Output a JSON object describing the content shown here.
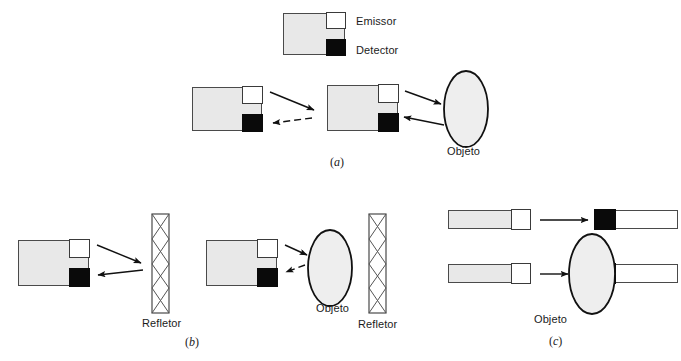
{
  "figure": {
    "caption_style": "three-panel optical sensor principle diagram",
    "background": "#ffffff",
    "stroke": "#1b1b1b",
    "body_fill": "#e8e8e8",
    "detector_fill": "#0a0a0a",
    "emitter_fill": "#ffffff"
  },
  "legend": {
    "emissor_label": "Emissor",
    "detector_label": "Detector"
  },
  "panels": [
    {
      "id": "a",
      "label": "(a)",
      "label_text": "a",
      "objects": [
        {
          "name": "objeto",
          "label": "Objeto"
        }
      ]
    },
    {
      "id": "b",
      "label": "(b)",
      "label_text": "b",
      "objects": [
        {
          "name": "refletor-left",
          "label": "Refletor"
        },
        {
          "name": "objeto",
          "label": "Objeto"
        },
        {
          "name": "refletor-right",
          "label": "Refletor"
        }
      ]
    },
    {
      "id": "c",
      "label": "(c)",
      "label_text": "c",
      "objects": [
        {
          "name": "objeto",
          "label": "Objeto"
        }
      ]
    }
  ],
  "labels": {
    "emissor": "Emissor",
    "detector": "Detector",
    "objeto_a": "Objeto",
    "refletor_b1": "Refletor",
    "objeto_b": "Objeto",
    "refletor_b2": "Refletor",
    "objeto_c": "Objeto",
    "panel_a": "a",
    "panel_b": "b",
    "panel_c": "c",
    "paren_open": "(",
    "paren_close": ")"
  }
}
